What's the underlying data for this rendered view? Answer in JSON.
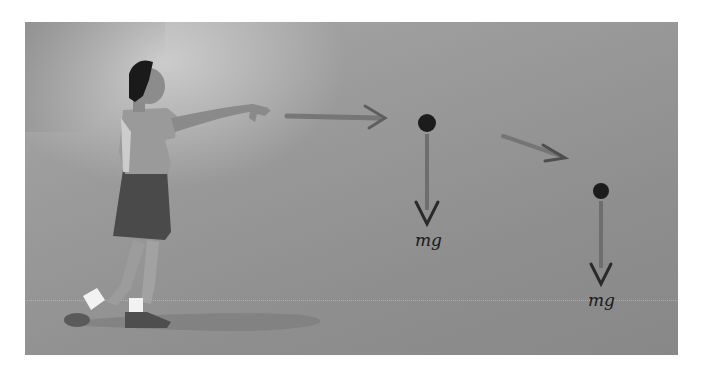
{
  "figure": {
    "colors": {
      "background_light": "#a8a8a8",
      "background_dark": "#888888",
      "ball": "#1c1c1c",
      "force_arrow": "#6e6e6e",
      "velocity_arrow": "#707070",
      "label_text": "#1a1a1a"
    },
    "balls": [
      {
        "name": "ball-position-1",
        "force_label": "mg"
      },
      {
        "name": "ball-position-2",
        "force_label": "mg"
      }
    ],
    "velocity_arrows": [
      {
        "name": "horizontal-velocity-arrow",
        "direction": "right"
      },
      {
        "name": "downward-velocity-arrow",
        "direction": "down-right"
      }
    ]
  }
}
